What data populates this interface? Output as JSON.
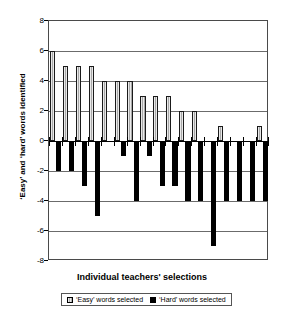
{
  "chart_data": {
    "type": "bar",
    "title": "",
    "xlabel": "Individual teachers' selections",
    "ylabel": "‘Easy’ and ‘hard’ words identified",
    "ylim": [
      -8,
      8
    ],
    "ytick_labels": [
      "8",
      "6",
      "4",
      "2",
      "0",
      "-2",
      "-4",
      "-6",
      "-8"
    ],
    "ytick_values": [
      8,
      6,
      4,
      2,
      0,
      -2,
      -4,
      -6,
      -8
    ],
    "grid": true,
    "xtick_labels": [],
    "legend_position": "bottom",
    "categories": [
      "1",
      "2",
      "3",
      "4",
      "5",
      "6",
      "7",
      "8",
      "9",
      "10",
      "11",
      "12",
      "13",
      "14",
      "15",
      "16",
      "17"
    ],
    "series": [
      {
        "name": "‘Easy’ words selected",
        "color": "#a8a8a8",
        "values": [
          6,
          5,
          5,
          5,
          4,
          4,
          4,
          3,
          3,
          3,
          2,
          2,
          0,
          1,
          0,
          0,
          1
        ]
      },
      {
        "name": "‘Hard’ words selected",
        "color": "#000000",
        "values": [
          -2,
          -2,
          -3,
          -5,
          0,
          -1,
          -4,
          -1,
          -3,
          -3,
          -4,
          -4,
          -7,
          -4,
          -4,
          -4,
          -4
        ]
      }
    ]
  },
  "legend": {
    "easy_label": "‘Easy’ words selected",
    "hard_label": "‘Hard’ words selected"
  },
  "axes": {
    "x_title": "Individual teachers' selections",
    "y_title": "‘Easy’ and ‘hard’ words identified"
  }
}
